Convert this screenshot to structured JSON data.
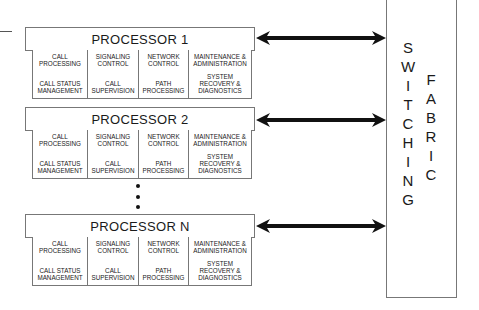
{
  "processors": [
    {
      "title": "PROCESSOR  1",
      "functions": [
        {
          "top": "CALL\nPROCESSING",
          "bottom": "CALL STATUS\nMANAGEMENT"
        },
        {
          "top": "SIGNALING\nCONTROL",
          "bottom": "CALL\nSUPERVISION"
        },
        {
          "top": "NETWORK\nCONTROL",
          "bottom": "PATH\nPROCESSING"
        },
        {
          "top": "MAINTENANCE &\nADMINISTRATION",
          "bottom": "SYSTEM\nRECOVERY &\nDIAGNOSTICS"
        }
      ]
    },
    {
      "title": "PROCESSOR  2",
      "functions": [
        {
          "top": "CALL\nPROCESSING",
          "bottom": "CALL STATUS\nMANAGEMENT"
        },
        {
          "top": "SIGNALING\nCONTROL",
          "bottom": "CALL\nSUPERVISION"
        },
        {
          "top": "NETWORK\nCONTROL",
          "bottom": "PATH\nPROCESSING"
        },
        {
          "top": "MAINTENANCE &\nADMINISTRATION",
          "bottom": "SYSTEM\nRECOVERY &\nDIAGNOSTICS"
        }
      ]
    },
    {
      "title": "PROCESSOR  N",
      "functions": [
        {
          "top": "CALL\nPROCESSING",
          "bottom": "CALL STATUS\nMANAGEMENT"
        },
        {
          "top": "SIGNALING\nCONTROL",
          "bottom": "CALL\nSUPERVISION"
        },
        {
          "top": "NETWORK\nCONTROL",
          "bottom": "PATH\nPROCESSING"
        },
        {
          "top": "MAINTENANCE &\nADMINISTRATION",
          "bottom": "SYSTEM\nRECOVERY &\nDIAGNOSTICS"
        }
      ]
    }
  ],
  "ellipsis": "⋮",
  "fabric": {
    "word1": [
      "S",
      "W",
      "I",
      "T",
      "C",
      "H",
      "I",
      "N",
      "G"
    ],
    "word2": [
      "F",
      "A",
      "B",
      "R",
      "I",
      "C"
    ],
    "label": "SWITCHING FABRIC"
  },
  "arrow_type": "bidirectional"
}
